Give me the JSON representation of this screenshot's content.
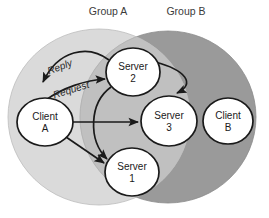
{
  "diagram": {
    "groups": [
      {
        "id": "group-a",
        "label": "Group A",
        "color": "#d2d2d2",
        "label_x": 108,
        "label_y": 15,
        "cx": 99,
        "cy": 117,
        "rx": 91,
        "ry": 88
      },
      {
        "id": "group-b",
        "label": "Group B",
        "color": "#9a9a9a",
        "label_x": 186,
        "label_y": 15,
        "cx": 168,
        "cy": 117,
        "rx": 88,
        "ry": 86
      }
    ],
    "overlap_color": "#c0c0c0",
    "node_fill": "#ffffff",
    "node_stroke": "#1a1a1a",
    "edge_color": "#1a1a1a",
    "nodes": [
      {
        "id": "client-a",
        "line1": "Client",
        "line2": "A",
        "cx": 45,
        "cy": 122,
        "rx": 28,
        "ry": 24
      },
      {
        "id": "server-2",
        "line1": "Server",
        "line2": "2",
        "cx": 133,
        "cy": 72,
        "rx": 27,
        "ry": 24
      },
      {
        "id": "server-3",
        "line1": "Server",
        "line2": "3",
        "cx": 169,
        "cy": 121,
        "rx": 28,
        "ry": 25
      },
      {
        "id": "server-1",
        "line1": "Server",
        "line2": "1",
        "cx": 132,
        "cy": 172,
        "rx": 27,
        "ry": 24
      },
      {
        "id": "client-b",
        "line1": "Client",
        "line2": "B",
        "cx": 228,
        "cy": 121,
        "rx": 25,
        "ry": 23
      }
    ],
    "edge_labels": [
      {
        "id": "reply-label",
        "text": "Reply",
        "x": 61,
        "y": 70,
        "rotate": -21
      },
      {
        "id": "request-label",
        "text": "Request",
        "x": 72,
        "y": 93,
        "rotate": -17
      }
    ],
    "edges": [
      {
        "id": "edge-client-a-to-server-2",
        "from": "client-a",
        "to": "server-2",
        "label": "Request"
      },
      {
        "id": "edge-server-2-to-client-a",
        "from": "server-2",
        "to": "client-a",
        "label": "Reply"
      },
      {
        "id": "edge-client-a-to-server-3",
        "from": "client-a",
        "to": "server-3",
        "label": ""
      },
      {
        "id": "edge-client-a-to-server-1",
        "from": "client-a",
        "to": "server-1",
        "label": ""
      },
      {
        "id": "edge-server-2-to-server-3",
        "from": "server-2",
        "to": "server-3",
        "label": ""
      },
      {
        "id": "edge-server-2-to-server-1",
        "from": "server-2",
        "to": "server-1",
        "label": ""
      }
    ]
  }
}
